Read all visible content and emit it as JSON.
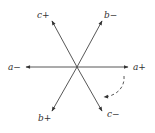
{
  "diagram": {
    "type": "phasor-diagram",
    "center": [
      77,
      67
    ],
    "color": "#333333",
    "axes": [
      {
        "id": "a_plus",
        "label": "a+",
        "tip": [
          128,
          67
        ],
        "label_pos": [
          133,
          70
        ]
      },
      {
        "id": "a_minus",
        "label": "a−",
        "tip": [
          26,
          67
        ],
        "label_pos": [
          9,
          70
        ]
      },
      {
        "id": "b_minus",
        "label": "b−",
        "tip": [
          102,
          21
        ],
        "label_pos": [
          104,
          19
        ]
      },
      {
        "id": "b_plus",
        "label": "b+",
        "tip": [
          52,
          111
        ],
        "label_pos": [
          39,
          122
        ]
      },
      {
        "id": "c_plus",
        "label": "c+",
        "tip": [
          52,
          21
        ],
        "label_pos": [
          38,
          19
        ]
      },
      {
        "id": "c_minus",
        "label": "c−",
        "tip": [
          102,
          111
        ],
        "label_pos": [
          107,
          117
        ]
      }
    ],
    "rotation_arrow": {
      "style": "dashed",
      "direction": "clockwise",
      "from_axis": "a+",
      "to_axis": "c−"
    }
  }
}
